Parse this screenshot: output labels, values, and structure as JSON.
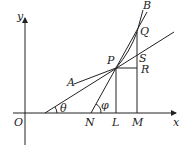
{
  "diagram": {
    "type": "geometry-derivative-figure",
    "labels": {
      "y_axis": "y",
      "x_axis": "x",
      "origin": "O",
      "A": "A",
      "B": "B",
      "P": "P",
      "Q": "Q",
      "R": "R",
      "S": "S",
      "N": "N",
      "L": "L",
      "M": "M",
      "theta": "θ",
      "phi": "φ"
    },
    "points": {
      "O": [
        25,
        113
      ],
      "P": [
        116,
        68
      ],
      "Q": [
        137,
        32
      ],
      "R": [
        137,
        68
      ],
      "S": [
        137,
        55
      ],
      "N": [
        91,
        113
      ],
      "L": [
        116,
        113
      ],
      "M": [
        137,
        113
      ],
      "theta_vertex": [
        45,
        113
      ]
    },
    "colors": {
      "stroke": "#222222",
      "background": "#ffffff"
    }
  }
}
